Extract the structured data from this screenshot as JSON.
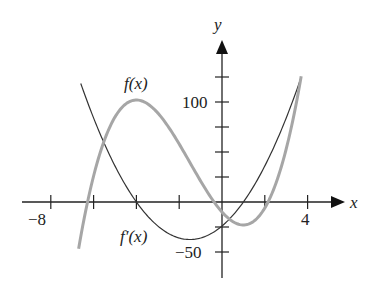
{
  "chart_data": {
    "type": "line",
    "title": "",
    "xlabel": "x",
    "ylabel": "y",
    "x_ticks": [
      -8,
      -6,
      -4,
      -2,
      0,
      2,
      4
    ],
    "x_tick_labels": {
      "-8": "−8",
      "4": "4"
    },
    "y_ticks": [
      -50,
      -25,
      25,
      50,
      75,
      100,
      125
    ],
    "y_tick_labels": {
      "100": "100",
      "-50": "−50"
    },
    "xlim": [
      -9.3,
      6
    ],
    "ylim": [
      -70,
      160
    ],
    "grid": false,
    "series": [
      {
        "name": "f(x)",
        "formula": "2x^3+9x^2-24x-10",
        "color": "#a6a6a6",
        "domain": [
          -6.7,
          3.7
        ],
        "points": [
          [
            -6.7,
            -47
          ],
          [
            -6,
            -10
          ],
          [
            -5,
            75
          ],
          [
            -4,
            102
          ],
          [
            -3,
            89
          ],
          [
            -2,
            58
          ],
          [
            -1,
            21
          ],
          [
            0,
            -10
          ],
          [
            1,
            -23
          ],
          [
            2,
            -6
          ],
          [
            3,
            53
          ],
          [
            3.7,
            119
          ]
        ]
      },
      {
        "name": "f'(x)",
        "formula": "6x^2+18x-24",
        "color": "#333333",
        "domain": [
          -6.6,
          3.7
        ],
        "points": [
          [
            -6.6,
            118.6
          ],
          [
            -6,
            60
          ],
          [
            -5,
            36
          ],
          [
            -4,
            0
          ],
          [
            -3,
            -24
          ],
          [
            -1.5,
            -37.5
          ],
          [
            0,
            -24
          ],
          [
            1,
            0
          ],
          [
            2,
            36
          ],
          [
            3,
            84
          ],
          [
            3.7,
            124.7
          ]
        ]
      }
    ],
    "annotations": [
      {
        "text": "f(x)",
        "near": [
          -4.3,
          112
        ]
      },
      {
        "text": "f′(x)",
        "near": [
          -4.4,
          -35
        ]
      }
    ]
  },
  "labels": {
    "x_axis": "x",
    "y_axis": "y",
    "tick_neg8": "−8",
    "tick_4": "4",
    "tick_100": "100",
    "tick_neg50": "−50",
    "f_label": "f(x)",
    "fprime_label": "f′(x)"
  }
}
